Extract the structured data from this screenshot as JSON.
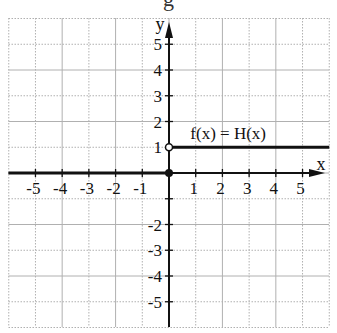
{
  "header_fragment": "g",
  "chart_data": {
    "type": "line",
    "title": "",
    "function_label": "f(x) = H(x)",
    "xlabel": "x",
    "ylabel": "y",
    "xlim": [
      -6,
      6
    ],
    "ylim": [
      -6,
      6
    ],
    "grid": true,
    "x_ticks": [
      -5,
      -4,
      -3,
      -2,
      -1,
      1,
      2,
      3,
      4,
      5
    ],
    "x_tick_labels": [
      "-5",
      "-4",
      "-3",
      "-2",
      "-1",
      "1",
      "2",
      "3",
      "4",
      "5"
    ],
    "y_ticks": [
      -5,
      -4,
      -3,
      -2,
      1,
      2,
      3,
      4,
      5
    ],
    "y_tick_labels": [
      "-5",
      "-4",
      "-3",
      "-2",
      "1",
      "2",
      "3",
      "4",
      "5"
    ],
    "series": [
      {
        "name": "f(x) = H(x)",
        "segments": [
          {
            "x": [
              -6,
              0
            ],
            "y": [
              0,
              0
            ],
            "left_endpoint": "none",
            "right_endpoint": "closed"
          },
          {
            "x": [
              0,
              6
            ],
            "y": [
              1,
              1
            ],
            "left_endpoint": "open",
            "right_endpoint": "none"
          }
        ]
      }
    ],
    "points": [
      {
        "x": 0,
        "y": 0,
        "style": "closed"
      },
      {
        "x": 0,
        "y": 1,
        "style": "open"
      }
    ],
    "colors": {
      "curve": "#111111",
      "grid": "#b0b0b0",
      "axis": "#111111"
    }
  }
}
